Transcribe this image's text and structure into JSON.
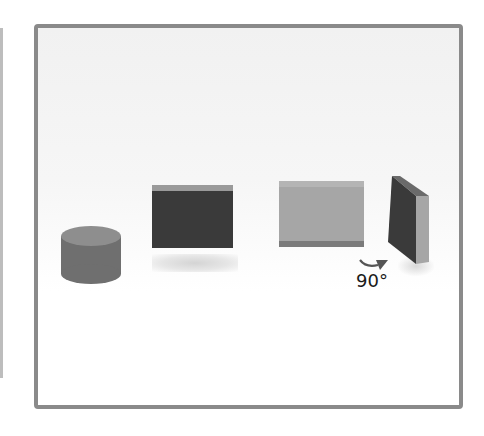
{
  "diagram": {
    "frame_color": "#8a8a8a",
    "objects": [
      {
        "name": "cylinder",
        "color": "#6f6f6f",
        "top_color": "#8e8e8e"
      },
      {
        "name": "dark-block",
        "color": "#3a3a3a",
        "top_color": "#9a9a9a"
      },
      {
        "name": "light-block",
        "color": "#a6a6a6",
        "top_color": "#b4b4b4",
        "bottom_color": "#7b7b7b"
      },
      {
        "name": "rotated-slab",
        "front_color": "#3a3a3a",
        "side_color": "#a6a6a6",
        "top_color": "#6a6a6a"
      }
    ],
    "rotation": {
      "label": "90°",
      "arrow_color": "#555555"
    }
  }
}
